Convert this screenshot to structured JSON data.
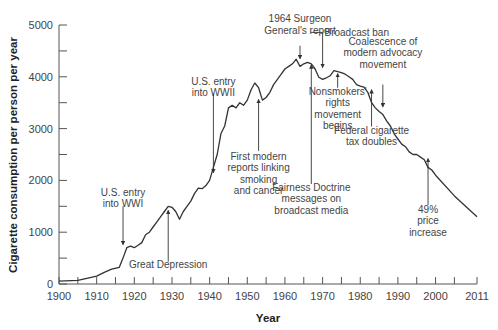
{
  "chart_data": {
    "type": "line",
    "title": "",
    "xlabel": "Year",
    "ylabel": "Cigarette consumption per person per year",
    "xlim": [
      1900,
      2011
    ],
    "ylim": [
      0,
      5000
    ],
    "grid": false,
    "legend": null,
    "x_ticks": [
      1900,
      1910,
      1920,
      1930,
      1940,
      1950,
      1960,
      1970,
      1980,
      1990,
      2000,
      2011
    ],
    "x_minor_ticks_every": 5,
    "y_ticks": [
      0,
      1000,
      2000,
      3000,
      4000,
      5000
    ],
    "y_minor_ticks_every": 500,
    "series": [
      {
        "name": "Cigarette consumption per person per year",
        "x": [
          1900,
          1905,
          1908,
          1910,
          1912,
          1914,
          1916,
          1917,
          1918,
          1919,
          1920,
          1921,
          1922,
          1923,
          1924,
          1925,
          1926,
          1927,
          1928,
          1929,
          1930,
          1931,
          1932,
          1933,
          1934,
          1935,
          1936,
          1937,
          1938,
          1939,
          1940,
          1941,
          1942,
          1943,
          1944,
          1945,
          1946,
          1947,
          1948,
          1949,
          1950,
          1951,
          1952,
          1953,
          1954,
          1955,
          1956,
          1957,
          1958,
          1959,
          1960,
          1961,
          1962,
          1963,
          1964,
          1965,
          1966,
          1967,
          1968,
          1969,
          1970,
          1971,
          1972,
          1973,
          1974,
          1975,
          1976,
          1977,
          1978,
          1979,
          1980,
          1981,
          1982,
          1983,
          1984,
          1985,
          1986,
          1987,
          1988,
          1989,
          1990,
          1991,
          1992,
          1993,
          1994,
          1995,
          1996,
          1997,
          1998,
          1999,
          2000,
          2005,
          2011
        ],
        "values": [
          54,
          70,
          120,
          151,
          223,
          285,
          323,
          500,
          700,
          730,
          700,
          750,
          800,
          950,
          1000,
          1100,
          1200,
          1300,
          1400,
          1500,
          1480,
          1400,
          1250,
          1400,
          1500,
          1600,
          1750,
          1850,
          1840,
          1900,
          2000,
          2250,
          2500,
          2900,
          3050,
          3400,
          3450,
          3400,
          3500,
          3450,
          3550,
          3750,
          3880,
          3790,
          3550,
          3600,
          3700,
          3850,
          3950,
          4050,
          4150,
          4200,
          4250,
          4340,
          4200,
          4250,
          4280,
          4250,
          4150,
          3990,
          3950,
          3980,
          4020,
          4120,
          4100,
          4080,
          4050,
          4000,
          3950,
          3850,
          3820,
          3800,
          3700,
          3500,
          3400,
          3330,
          3270,
          3150,
          3050,
          2900,
          2800,
          2700,
          2650,
          2550,
          2500,
          2500,
          2450,
          2400,
          2250,
          2200,
          2100,
          1700,
          1300
        ]
      }
    ],
    "annotations": [
      {
        "id": "wwi",
        "lines": [
          "U.S. entry",
          "into WWI"
        ],
        "text_x": 1917,
        "text_y": 1700,
        "arrow_from_y": 1500,
        "arrow_to": [
          1917,
          760
        ],
        "direction": "down"
      },
      {
        "id": "depression",
        "lines": [
          "Great Depression"
        ],
        "text_x": 1929,
        "text_y": 300,
        "arrow_from_y": 430,
        "arrow_to": [
          1929,
          1420
        ],
        "direction": "up"
      },
      {
        "id": "wwii",
        "lines": [
          "U.S. entry",
          "into WWII"
        ],
        "text_x": 1941,
        "text_y": 3850,
        "arrow_from_y": 3680,
        "arrow_to": [
          1941,
          2150
        ],
        "direction": "down"
      },
      {
        "id": "reports",
        "lines": [
          "First modern",
          "reports linking",
          "smoking",
          "and cancer"
        ],
        "text_x": 1953,
        "text_y": 2400,
        "arrow_from_y": 2570,
        "arrow_to": [
          1953,
          3560
        ],
        "direction": "up"
      },
      {
        "id": "surgeon",
        "lines": [
          "1964 Surgeon",
          "General's report"
        ],
        "text_x": 1964,
        "text_y": 5050,
        "arrow_from_y": 4600,
        "arrow_to": [
          1964,
          4350
        ],
        "direction": "down"
      },
      {
        "id": "broadcast_ban",
        "lines": [
          "Broadcast ban"
        ],
        "text_x": 1978,
        "text_y": 4780,
        "arrow_from_y": 4800,
        "arrow_to": [
          1970,
          4180
        ],
        "direction": "down",
        "elbow": true
      },
      {
        "id": "fairness",
        "lines": [
          "Fairness Doctrine",
          "messages on",
          "broadcast media"
        ],
        "text_x": 1967,
        "text_y": 1800,
        "arrow_from_y": 1930,
        "arrow_to": [
          1967,
          4230
        ],
        "direction": "up"
      },
      {
        "id": "nonsmokers",
        "lines": [
          "Nonsmokers'",
          "rights",
          "movement",
          "begins"
        ],
        "text_x": 1974,
        "text_y": 3650,
        "arrow_from_y": 3790,
        "arrow_to": [
          1974,
          4060
        ],
        "direction": "up"
      },
      {
        "id": "advocacy",
        "lines": [
          "Coalescence of",
          "modern advocacy",
          "movement"
        ],
        "text_x": 1986,
        "text_y": 4620,
        "arrow_from_y": 3850,
        "arrow_to": [
          1986,
          3420
        ],
        "direction": "down"
      },
      {
        "id": "tax",
        "lines": [
          "Federal cigarette",
          "tax doubles"
        ],
        "text_x": 1983,
        "text_y": 2900,
        "arrow_from_y": 3040,
        "arrow_to": [
          1983,
          3750
        ],
        "direction": "up"
      },
      {
        "id": "price",
        "lines": [
          "49%",
          "price",
          "increase"
        ],
        "text_x": 1998,
        "text_y": 1380,
        "arrow_from_y": 1520,
        "arrow_to": [
          1998,
          2420
        ],
        "direction": "up"
      }
    ]
  }
}
